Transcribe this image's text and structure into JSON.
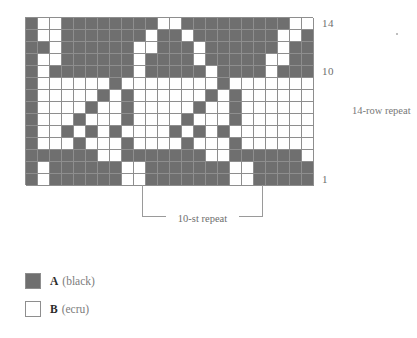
{
  "chart": {
    "type": "knitting-colorwork-chart",
    "columns": 24,
    "rows": 14,
    "symbols": {
      "A": {
        "key": "A",
        "description": "(black)",
        "color": "#6f6f6f"
      },
      "B": {
        "key": "B",
        "description": "(ecru)",
        "color": "#ffffff"
      }
    },
    "row_labels": [
      {
        "row": 14,
        "text": "14"
      },
      {
        "row": 10,
        "text": "10"
      },
      {
        "row": 1,
        "text": "1"
      }
    ],
    "row_repeat_note": "14-row repeat",
    "stitch_repeat_label": "10-st repeat",
    "stitch_repeat_count": 10,
    "row_repeat_count": 14,
    "grid": [
      "ABBAAAAAAAABBAAAAAAAAABBA",
      "ABBAAAAAAABAABAAAAAAABBAA",
      "AABAAAAAABBAAABAAAAAABAAB",
      "ABBAAAAAABAAAABAAAAABBAAA",
      "ABAAAAAAABAAAAABAAAABAAAA",
      "ABBBBBBABBBBBBBBABBBBBBBB",
      "ABBBBBABABBBBBBABABBBBBBB",
      "ABBBBABBABBBBBABBABBBBBBB",
      "ABBBABBBABBBBABBBABBBBBBB",
      "ABBABABABBBBABABABBBBBBBB",
      "ABBBABBBABBBBABBBABBBBBBB",
      "AAAAAABBAAAAAAABBAAAAAABB",
      "ABAAAAAABBAAAAAAABBAAAAAB",
      "ABAAAAAABBAAAAAAABBAAAAAB"
    ]
  }
}
